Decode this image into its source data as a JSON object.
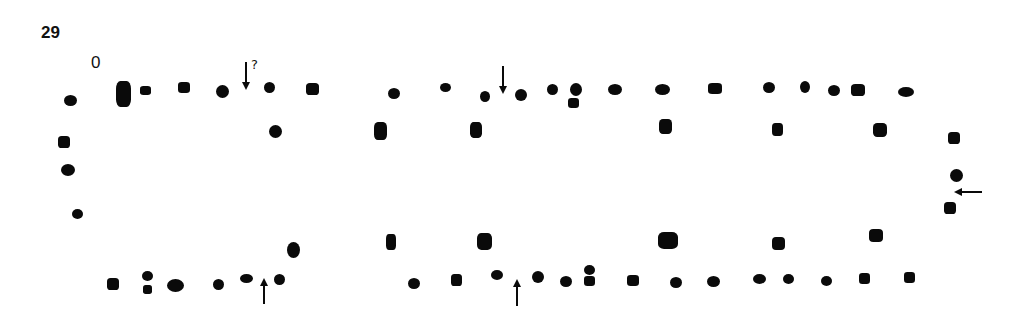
{
  "figure": {
    "number": "29",
    "origin_label": "0",
    "question_mark": "?"
  },
  "colors": {
    "ink": "#0a0a0a",
    "background": "#ffffff"
  },
  "arrows": [
    {
      "id": "arrow-top-left",
      "direction": "down",
      "x": 246,
      "y1": 62,
      "y2": 86,
      "uncertain": true
    },
    {
      "id": "arrow-top-middle",
      "direction": "down",
      "x": 503,
      "y1": 66,
      "y2": 90,
      "uncertain": false
    },
    {
      "id": "arrow-bottom-left",
      "direction": "up",
      "x": 264,
      "y1": 304,
      "y2": 282,
      "uncertain": false
    },
    {
      "id": "arrow-bottom-middle",
      "direction": "up",
      "x": 517,
      "y1": 306,
      "y2": 283,
      "uncertain": false
    },
    {
      "id": "arrow-right-end",
      "direction": "left",
      "y": 192,
      "x1": 982,
      "x2": 958,
      "uncertain": false
    }
  ],
  "postholes": [
    {
      "x": 70,
      "y": 100,
      "w": 13,
      "h": 11,
      "shape": "oval"
    },
    {
      "x": 123,
      "y": 94,
      "w": 15,
      "h": 26,
      "shape": "square"
    },
    {
      "x": 145,
      "y": 90,
      "w": 11,
      "h": 9,
      "shape": "square"
    },
    {
      "x": 184,
      "y": 87,
      "w": 12,
      "h": 11,
      "shape": "square"
    },
    {
      "x": 222,
      "y": 91,
      "w": 13,
      "h": 13,
      "shape": "round"
    },
    {
      "x": 269,
      "y": 87,
      "w": 11,
      "h": 11,
      "shape": "round"
    },
    {
      "x": 312,
      "y": 89,
      "w": 13,
      "h": 12,
      "shape": "square"
    },
    {
      "x": 275,
      "y": 131,
      "w": 13,
      "h": 13,
      "shape": "round"
    },
    {
      "x": 64,
      "y": 142,
      "w": 12,
      "h": 12,
      "shape": "square"
    },
    {
      "x": 68,
      "y": 170,
      "w": 14,
      "h": 12,
      "shape": "oval"
    },
    {
      "x": 77,
      "y": 214,
      "w": 11,
      "h": 10,
      "shape": "round"
    },
    {
      "x": 113,
      "y": 284,
      "w": 12,
      "h": 12,
      "shape": "square"
    },
    {
      "x": 147,
      "y": 276,
      "w": 11,
      "h": 10,
      "shape": "round"
    },
    {
      "x": 147,
      "y": 289,
      "w": 9,
      "h": 9,
      "shape": "square"
    },
    {
      "x": 175,
      "y": 285,
      "w": 17,
      "h": 13,
      "shape": "oval"
    },
    {
      "x": 218,
      "y": 284,
      "w": 11,
      "h": 11,
      "shape": "round"
    },
    {
      "x": 246,
      "y": 278,
      "w": 13,
      "h": 9,
      "shape": "oval"
    },
    {
      "x": 279,
      "y": 279,
      "w": 11,
      "h": 11,
      "shape": "round"
    },
    {
      "x": 293,
      "y": 250,
      "w": 13,
      "h": 16,
      "shape": "oval"
    },
    {
      "x": 394,
      "y": 93,
      "w": 12,
      "h": 11,
      "shape": "round"
    },
    {
      "x": 445,
      "y": 87,
      "w": 11,
      "h": 9,
      "shape": "oval"
    },
    {
      "x": 485,
      "y": 96,
      "w": 10,
      "h": 11,
      "shape": "round"
    },
    {
      "x": 521,
      "y": 95,
      "w": 12,
      "h": 12,
      "shape": "round"
    },
    {
      "x": 552,
      "y": 89,
      "w": 11,
      "h": 11,
      "shape": "round"
    },
    {
      "x": 576,
      "y": 89,
      "w": 12,
      "h": 13,
      "shape": "round"
    },
    {
      "x": 573,
      "y": 103,
      "w": 11,
      "h": 10,
      "shape": "square"
    },
    {
      "x": 615,
      "y": 89,
      "w": 14,
      "h": 11,
      "shape": "oval"
    },
    {
      "x": 662,
      "y": 89,
      "w": 15,
      "h": 11,
      "shape": "oval"
    },
    {
      "x": 715,
      "y": 88,
      "w": 14,
      "h": 11,
      "shape": "square"
    },
    {
      "x": 769,
      "y": 87,
      "w": 12,
      "h": 11,
      "shape": "round"
    },
    {
      "x": 805,
      "y": 87,
      "w": 10,
      "h": 12,
      "shape": "round"
    },
    {
      "x": 834,
      "y": 90,
      "w": 12,
      "h": 11,
      "shape": "round"
    },
    {
      "x": 858,
      "y": 90,
      "w": 14,
      "h": 12,
      "shape": "square"
    },
    {
      "x": 906,
      "y": 92,
      "w": 16,
      "h": 10,
      "shape": "oval"
    },
    {
      "x": 380,
      "y": 131,
      "w": 13,
      "h": 18,
      "shape": "square"
    },
    {
      "x": 476,
      "y": 130,
      "w": 12,
      "h": 16,
      "shape": "square"
    },
    {
      "x": 665,
      "y": 126,
      "w": 13,
      "h": 15,
      "shape": "square"
    },
    {
      "x": 777,
      "y": 129,
      "w": 11,
      "h": 13,
      "shape": "square"
    },
    {
      "x": 880,
      "y": 130,
      "w": 14,
      "h": 14,
      "shape": "square"
    },
    {
      "x": 954,
      "y": 138,
      "w": 12,
      "h": 12,
      "shape": "square"
    },
    {
      "x": 956,
      "y": 175,
      "w": 13,
      "h": 13,
      "shape": "round"
    },
    {
      "x": 950,
      "y": 208,
      "w": 12,
      "h": 12,
      "shape": "square"
    },
    {
      "x": 391,
      "y": 242,
      "w": 10,
      "h": 16,
      "shape": "square"
    },
    {
      "x": 484,
      "y": 241,
      "w": 15,
      "h": 17,
      "shape": "square"
    },
    {
      "x": 668,
      "y": 240,
      "w": 20,
      "h": 17,
      "shape": "square"
    },
    {
      "x": 778,
      "y": 243,
      "w": 13,
      "h": 13,
      "shape": "square"
    },
    {
      "x": 876,
      "y": 235,
      "w": 14,
      "h": 13,
      "shape": "square"
    },
    {
      "x": 414,
      "y": 283,
      "w": 12,
      "h": 11,
      "shape": "oval"
    },
    {
      "x": 456,
      "y": 280,
      "w": 11,
      "h": 12,
      "shape": "square"
    },
    {
      "x": 497,
      "y": 275,
      "w": 12,
      "h": 10,
      "shape": "round"
    },
    {
      "x": 538,
      "y": 277,
      "w": 12,
      "h": 12,
      "shape": "round"
    },
    {
      "x": 566,
      "y": 281,
      "w": 12,
      "h": 11,
      "shape": "round"
    },
    {
      "x": 589,
      "y": 270,
      "w": 11,
      "h": 10,
      "shape": "round"
    },
    {
      "x": 589,
      "y": 281,
      "w": 11,
      "h": 10,
      "shape": "square"
    },
    {
      "x": 633,
      "y": 280,
      "w": 12,
      "h": 11,
      "shape": "square"
    },
    {
      "x": 676,
      "y": 282,
      "w": 12,
      "h": 11,
      "shape": "round"
    },
    {
      "x": 713,
      "y": 281,
      "w": 13,
      "h": 11,
      "shape": "round"
    },
    {
      "x": 759,
      "y": 279,
      "w": 13,
      "h": 10,
      "shape": "oval"
    },
    {
      "x": 788,
      "y": 279,
      "w": 11,
      "h": 10,
      "shape": "oval"
    },
    {
      "x": 826,
      "y": 281,
      "w": 11,
      "h": 10,
      "shape": "round"
    },
    {
      "x": 864,
      "y": 278,
      "w": 11,
      "h": 11,
      "shape": "square"
    },
    {
      "x": 909,
      "y": 277,
      "w": 11,
      "h": 11,
      "shape": "square"
    }
  ]
}
